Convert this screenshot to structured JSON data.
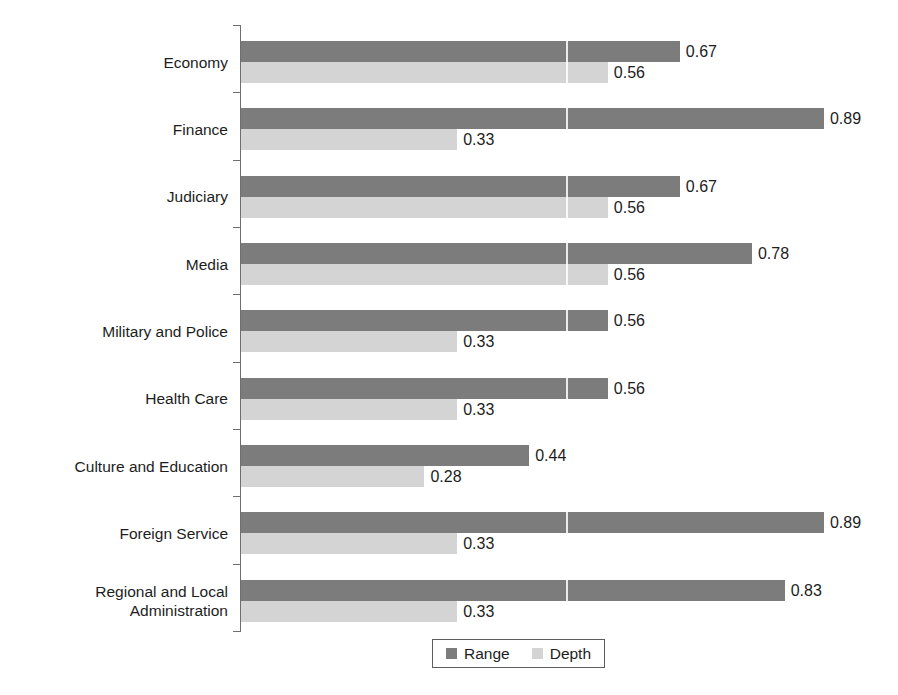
{
  "chart_data": {
    "type": "bar",
    "orientation": "horizontal",
    "title": "",
    "subtitle": "",
    "xlabel": "",
    "ylabel": "",
    "xlim": [
      0,
      1
    ],
    "grid": false,
    "legend_position": "bottom",
    "categories": [
      "Economy",
      "Finance",
      "Judiciary",
      "Media",
      "Military and Police",
      "Health Care",
      "Culture and Education",
      "Foreign Service",
      "Regional and Local\nAdministration"
    ],
    "series": [
      {
        "name": "Range",
        "color": "#7c7c7c",
        "values": [
          0.67,
          0.89,
          0.67,
          0.78,
          0.56,
          0.56,
          0.44,
          0.89,
          0.83
        ],
        "labels": [
          "0.67",
          "0.89",
          "0.67",
          "0.78",
          "0.56",
          "0.56",
          "0.44",
          "0.89",
          "0.83"
        ]
      },
      {
        "name": "Depth",
        "color": "#d4d4d4",
        "values": [
          0.56,
          0.33,
          0.56,
          0.56,
          0.33,
          0.33,
          0.28,
          0.33,
          0.33
        ],
        "labels": [
          "0.56",
          "0.33",
          "0.56",
          "0.56",
          "0.33",
          "0.33",
          "0.28",
          "0.33",
          "0.33"
        ]
      }
    ]
  },
  "legend": {
    "items": [
      {
        "label": "Range",
        "color": "#7c7c7c"
      },
      {
        "label": "Depth",
        "color": "#d4d4d4"
      }
    ]
  },
  "axis": {
    "tick_count": 10,
    "line_color": "#6e6e6e"
  }
}
